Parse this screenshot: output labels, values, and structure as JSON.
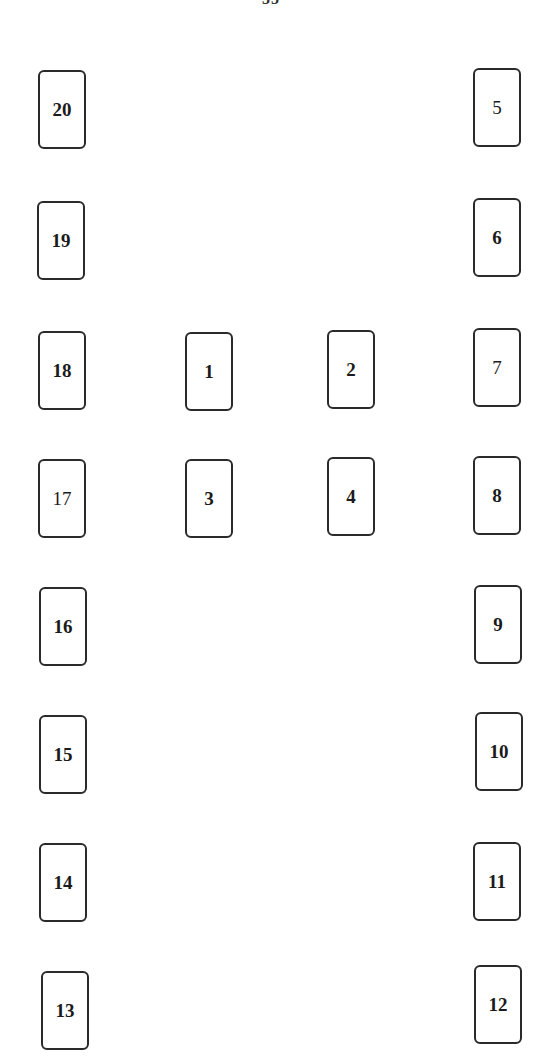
{
  "header": {
    "fragment": "55"
  },
  "diagram": {
    "cards": [
      {
        "label": "1",
        "x": 185,
        "y": 332
      },
      {
        "label": "2",
        "x": 327,
        "y": 330
      },
      {
        "label": "3",
        "x": 185,
        "y": 459
      },
      {
        "label": "4",
        "x": 327,
        "y": 457
      },
      {
        "label": "5",
        "x": 473,
        "y": 68
      },
      {
        "label": "6",
        "x": 473,
        "y": 198
      },
      {
        "label": "7",
        "x": 473,
        "y": 328
      },
      {
        "label": "8",
        "x": 473,
        "y": 456
      },
      {
        "label": "9",
        "x": 474,
        "y": 585
      },
      {
        "label": "10",
        "x": 475,
        "y": 712
      },
      {
        "label": "11",
        "x": 473,
        "y": 842
      },
      {
        "label": "12",
        "x": 474,
        "y": 965
      },
      {
        "label": "13",
        "x": 41,
        "y": 971
      },
      {
        "label": "14",
        "x": 39,
        "y": 843
      },
      {
        "label": "15",
        "x": 39,
        "y": 715
      },
      {
        "label": "16",
        "x": 39,
        "y": 587
      },
      {
        "label": "17",
        "x": 38,
        "y": 459
      },
      {
        "label": "18",
        "x": 38,
        "y": 331
      },
      {
        "label": "19",
        "x": 37,
        "y": 201
      },
      {
        "label": "20",
        "x": 38,
        "y": 70
      }
    ]
  }
}
